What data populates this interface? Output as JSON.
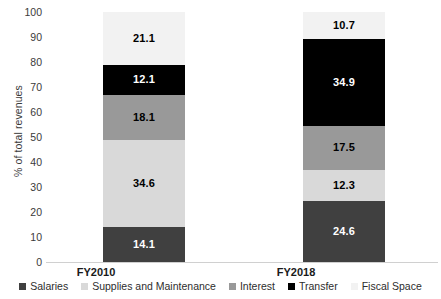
{
  "chart_data": {
    "type": "bar",
    "subtype": "stacked-bar-100",
    "title": "",
    "xlabel": "",
    "ylabel": "% of total revenues",
    "ylim": [
      0,
      100
    ],
    "ytick_step": 10,
    "yticks": [
      100,
      90,
      80,
      70,
      60,
      50,
      40,
      30,
      20,
      10,
      0
    ],
    "grid": false,
    "legend_position": "bottom",
    "categories": [
      "FY2010",
      "FY2018"
    ],
    "series": [
      {
        "name": "Salaries",
        "color": "#404040",
        "label_color": "#ffffff",
        "values": [
          14.1,
          24.6
        ]
      },
      {
        "name": "Supplies and Maintenance",
        "color": "#d9d9d9",
        "label_color": "#000000",
        "values": [
          34.6,
          12.3
        ]
      },
      {
        "name": "Interest",
        "color": "#999999",
        "label_color": "#000000",
        "values": [
          18.1,
          17.5
        ]
      },
      {
        "name": "Transfer",
        "color": "#000000",
        "label_color": "#ffffff",
        "values": [
          12.1,
          34.9
        ]
      },
      {
        "name": "Fiscal Space",
        "color": "#f2f2f2",
        "label_color": "#000000",
        "values": [
          21.1,
          10.7
        ]
      }
    ],
    "value_labels": {
      "FY2010": [
        "14.1",
        "34.6",
        "18.1",
        "12.1",
        "21.1"
      ],
      "FY2018": [
        "24.6",
        "12.3",
        "17.5",
        "34.9",
        "10.7"
      ]
    }
  },
  "axis": {
    "y_title": "% of total revenues",
    "tick_labels": [
      "100",
      "90",
      "80",
      "70",
      "60",
      "50",
      "40",
      "30",
      "20",
      "10",
      "0"
    ]
  },
  "legend": {
    "items": [
      {
        "label": "Salaries"
      },
      {
        "label": "Supplies and Maintenance"
      },
      {
        "label": "Interest"
      },
      {
        "label": "Transfer"
      },
      {
        "label": "Fiscal Space"
      }
    ]
  },
  "categories": [
    {
      "label": "FY2010"
    },
    {
      "label": "FY2018"
    }
  ]
}
